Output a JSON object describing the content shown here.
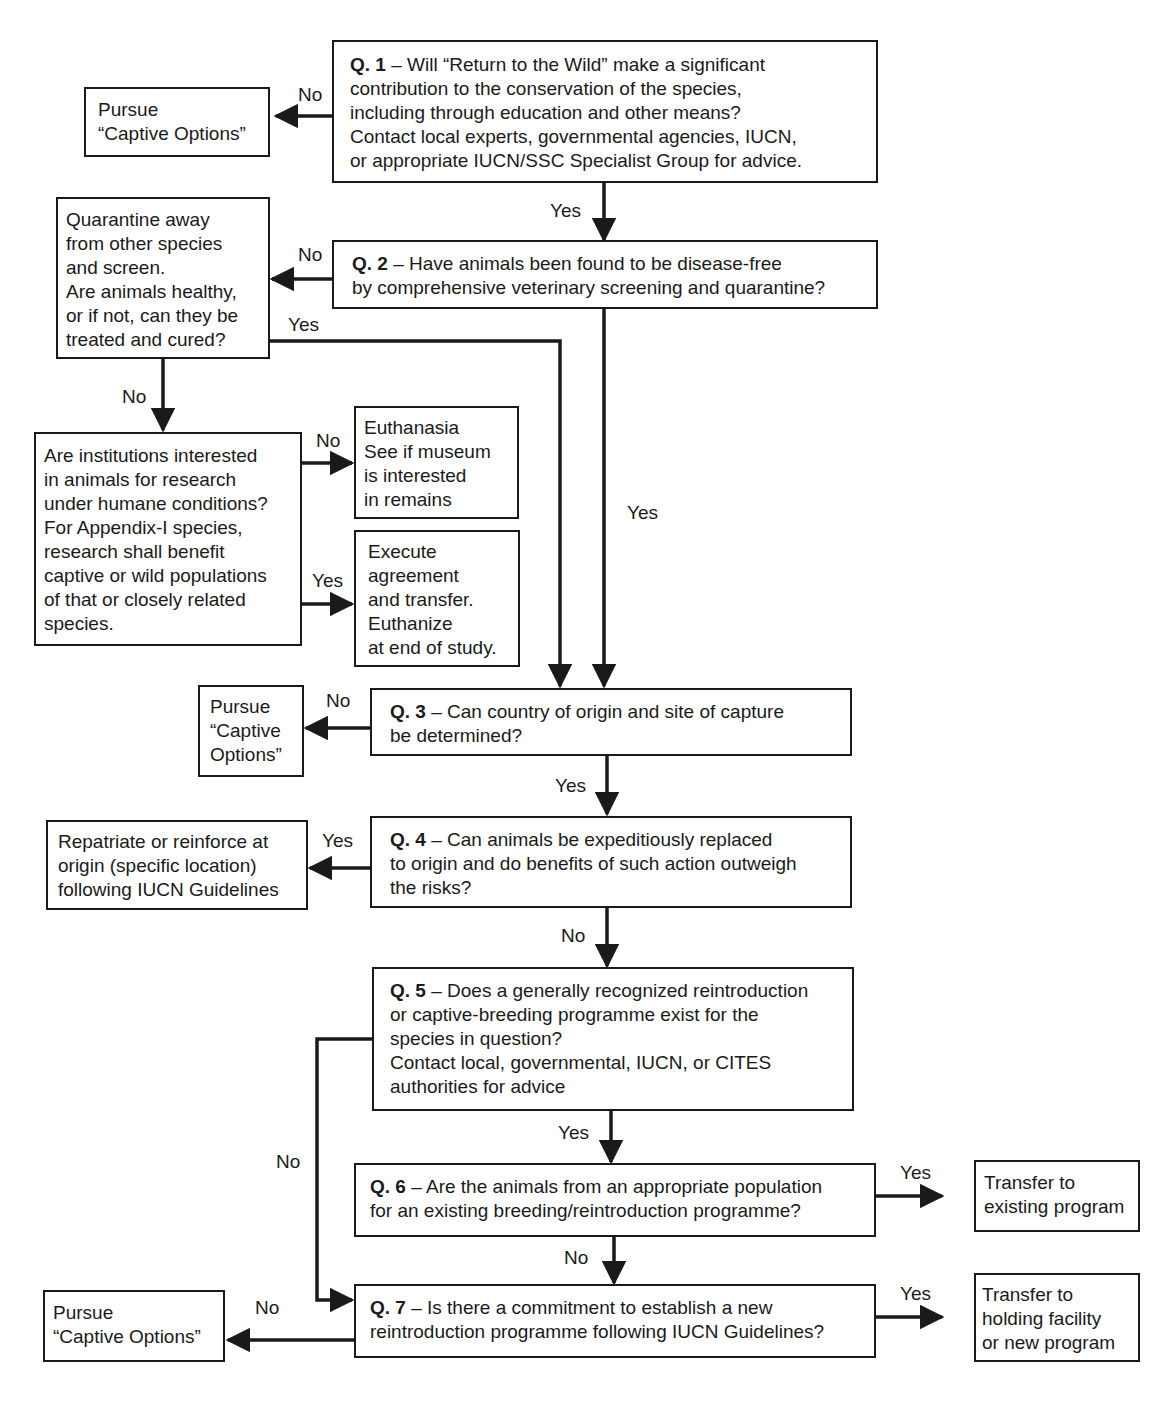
{
  "diagram": {
    "type": "flowchart",
    "line_color": "#1a1a1a",
    "background": "#ffffff"
  },
  "questions": {
    "q1": {
      "id": "Q. 1",
      "text": " – Will “Return to the Wild” make a significant\ncontribution  to the conservation of the species,\nincluding through education and other means?\nContact local experts, governmental agencies, IUCN,\nor appropriate IUCN/SSC Specialist Group for advice."
    },
    "q2": {
      "id": "Q. 2",
      "text": " – Have animals been found to be disease-free\nby comprehensive veterinary screening and quarantine?"
    },
    "q3": {
      "id": "Q. 3",
      "text": " – Can country of origin and site of capture\nbe determined?"
    },
    "q4": {
      "id": "Q. 4",
      "text": " – Can animals be expeditiously replaced\nto origin and do benefits of such action outweigh\nthe risks?"
    },
    "q5": {
      "id": "Q. 5",
      "text": " – Does a generally recognized reintroduction\nor captive-breeding programme exist for the\nspecies in question?\nContact local, governmental, IUCN, or CITES\nauthorities for advice"
    },
    "q6": {
      "id": "Q. 6",
      "text": " – Are the animals from an appropriate population\nfor an existing breeding/reintroduction programme?"
    },
    "q7": {
      "id": "Q. 7",
      "text": " – Is there a commitment to establish a new\nreintroduction programme following IUCN Guidelines?"
    }
  },
  "outcomes": {
    "captive_options_1": "Pursue\n“Captive Options”",
    "quarantine": "Quarantine away\nfrom other species\nand screen.\nAre animals healthy,\nor if not, can they be\ntreated and cured?",
    "research": "Are institutions interested\nin animals for research\nunder humane conditions?\nFor Appendix-I species,\nresearch shall benefit\ncaptive or wild populations\nof that or closely related\nspecies.",
    "euthanasia": "Euthanasia\nSee if museum\nis interested\nin remains",
    "execute": "Execute\nagreement\nand transfer.\nEuthanize\nat end of study.",
    "captive_options_3": "Pursue\n“Captive\nOptions”",
    "repatriate": "Repatriate or reinforce at\norigin (specific location)\nfollowing IUCN Guidelines",
    "transfer_existing": "Transfer to\nexisting program",
    "transfer_holding": "Transfer to\nholding facility\nor new program",
    "captive_options_7": "Pursue\n“Captive Options”"
  },
  "edge_labels": {
    "q1_no": "No",
    "q1_yes": "Yes",
    "q2_no": "No",
    "q2_yes": "Yes",
    "quarantine_yes": "Yes",
    "quarantine_no": "No",
    "research_no": "No",
    "research_yes": "Yes",
    "q3_no": "No",
    "q3_yes": "Yes",
    "q4_yes": "Yes",
    "q4_no": "No",
    "q5_yes": "Yes",
    "q5_no": "No",
    "q6_yes": "Yes",
    "q6_no": "No",
    "q7_yes": "Yes",
    "q7_no": "No"
  }
}
